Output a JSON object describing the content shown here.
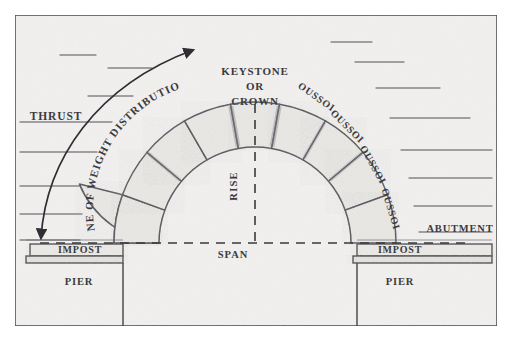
{
  "figure": {
    "border_color": "#4a4a4c",
    "paper_color": "#f2f1ef",
    "stone_fill": "#e9e8e5",
    "stone_stroke": "#53545a",
    "text_color": "#3b3b3f",
    "dashed_color": "#3a3a3d",
    "hatch_color": "#6e6f74"
  },
  "labels": {
    "keystone_line1": "KEYSTONE",
    "keystone_line2": "OR",
    "keystone_line3": "CROWN",
    "thrust": "THRUST",
    "line_of_weight": "LINE OF WEIGHT DISTRIBUTION",
    "rise": "RISE",
    "span": "SPAN",
    "abutment": "ABUTMENT",
    "impost_left": "IMPOST",
    "impost_right": "IMPOST",
    "pier_left": "PIER",
    "pier_right": "PIER",
    "voussoir_r1": "VOUSSOIR",
    "voussoir_r2": "VOUSSOIR",
    "voussoir_r3": "VOUSSOIR",
    "voussoir_r4": "VOUSSOIR"
  },
  "geometry": {
    "center_x": 255,
    "center_y": 243,
    "intrados_radius": 96,
    "extrados_radius": 141,
    "voussoir_count_total": 9,
    "voussoirs_per_side": 4,
    "springing_y": 243
  }
}
